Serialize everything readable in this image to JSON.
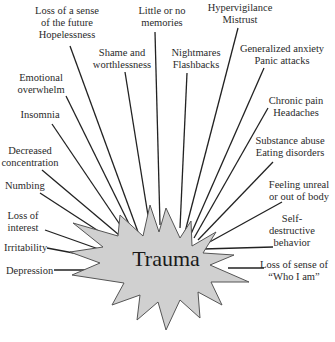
{
  "diagram": {
    "center": {
      "label": "Trauma",
      "fill": "#d0d0d0",
      "stroke": "#555555"
    },
    "line_color": "#222222",
    "labels": [
      {
        "id": "future",
        "lines": [
          "Loss of a sense",
          "of the future",
          "Hopelessness"
        ],
        "x": 67,
        "y": 5,
        "align": "center",
        "line_from": [
          70,
          46
        ],
        "line_to": [
          138,
          232
        ]
      },
      {
        "id": "memories",
        "lines": [
          "Little or no",
          "memories"
        ],
        "x": 162,
        "y": 5,
        "align": "center",
        "line_from": [
          155,
          32
        ],
        "line_to": [
          160,
          225
        ]
      },
      {
        "id": "hypervigilance",
        "lines": [
          "Hypervigilance",
          "Mistrust"
        ],
        "x": 240,
        "y": 2,
        "align": "center",
        "line_from": [
          238,
          28
        ],
        "line_to": [
          185,
          232
        ]
      },
      {
        "id": "shame",
        "lines": [
          "Shame and",
          "worthlessness"
        ],
        "x": 122,
        "y": 47,
        "align": "center",
        "line_from": [
          125,
          72
        ],
        "line_to": [
          150,
          228
        ]
      },
      {
        "id": "nightmares",
        "lines": [
          "Nightmares",
          "Flashbacks"
        ],
        "x": 196,
        "y": 47,
        "align": "center",
        "line_from": [
          187,
          73
        ],
        "line_to": [
          180,
          228
        ]
      },
      {
        "id": "anxiety",
        "lines": [
          "Generalized anxiety",
          "Panic attacks"
        ],
        "x": 282,
        "y": 43,
        "align": "center",
        "line_from": [
          264,
          68
        ],
        "line_to": [
          191,
          234
        ]
      },
      {
        "id": "emotional",
        "lines": [
          "Emotional",
          "overwhelm"
        ],
        "x": 41,
        "y": 72,
        "align": "center",
        "line_from": [
          66,
          96
        ],
        "line_to": [
          135,
          236
        ]
      },
      {
        "id": "chronic",
        "lines": [
          "Chronic pain",
          "Headaches"
        ],
        "x": 296,
        "y": 95,
        "align": "center",
        "line_from": [
          268,
          108
        ],
        "line_to": [
          194,
          238
        ]
      },
      {
        "id": "insomnia",
        "lines": [
          "Insomnia"
        ],
        "x": 40,
        "y": 109,
        "align": "center",
        "line_from": [
          52,
          124
        ],
        "line_to": [
          129,
          238
        ]
      },
      {
        "id": "substance",
        "lines": [
          "Substance abuse",
          "Eating disorders"
        ],
        "x": 290,
        "y": 135,
        "align": "center",
        "line_from": [
          273,
          162
        ],
        "line_to": [
          198,
          240
        ]
      },
      {
        "id": "concentration",
        "lines": [
          "Decreased",
          "concentration"
        ],
        "x": 30,
        "y": 145,
        "align": "center",
        "line_from": [
          42,
          170
        ],
        "line_to": [
          125,
          240
        ]
      },
      {
        "id": "numbing",
        "lines": [
          "Numbing"
        ],
        "x": 5,
        "y": 180,
        "align": "left",
        "line_from": [
          40,
          193
        ],
        "line_to": [
          120,
          245
        ]
      },
      {
        "id": "unreal",
        "lines": [
          "Feeling unreal",
          "or out of body"
        ],
        "x": 299,
        "y": 179,
        "align": "center",
        "line_from": [
          282,
          202
        ],
        "line_to": [
          206,
          244
        ]
      },
      {
        "id": "interest",
        "lines": [
          "Loss of",
          "interest"
        ],
        "x": 23,
        "y": 210,
        "align": "center",
        "line_from": [
          45,
          230
        ],
        "line_to": [
          107,
          252
        ]
      },
      {
        "id": "selfdestructive",
        "lines": [
          "Self-",
          "destructive",
          "behavior"
        ],
        "x": 292,
        "y": 213,
        "align": "center",
        "line_from": [
          273,
          247
        ],
        "line_to": [
          203,
          249
        ]
      },
      {
        "id": "irritability",
        "lines": [
          "Irritability"
        ],
        "x": 4,
        "y": 242,
        "align": "left",
        "line_from": [
          47,
          248
        ],
        "line_to": [
          100,
          258
        ]
      },
      {
        "id": "depression",
        "lines": [
          "Depression"
        ],
        "x": 6,
        "y": 265,
        "align": "left",
        "line_from": [
          54,
          270
        ],
        "line_to": [
          100,
          270
        ]
      },
      {
        "id": "whoiam",
        "lines": [
          "Loss of sense of",
          "“Who I am”"
        ],
        "x": 294,
        "y": 259,
        "align": "center",
        "line_from": [
          264,
          268
        ],
        "line_to": [
          228,
          268
        ]
      }
    ]
  }
}
